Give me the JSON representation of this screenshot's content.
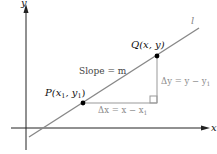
{
  "diagram": {
    "axes": {
      "x_label": "x",
      "y_label": "y"
    },
    "line": {
      "label": "l"
    },
    "points": [
      {
        "id": "P",
        "label": "P(x",
        "sub1": "1",
        "mid": ", y",
        "sub2": "1",
        "end": ")"
      },
      {
        "id": "Q",
        "label": "Q(x, y)"
      }
    ],
    "slope_label": "Slope = m",
    "delta_y": {
      "prefix": "Δy = y − y",
      "sub": "1"
    },
    "delta_x": {
      "prefix": "Δx = x − x",
      "sub": "1"
    },
    "colors": {
      "axis": "#222222",
      "line": "#888888",
      "triangle": "#999999",
      "delta_text": "#8a8a8a",
      "point": "#000000",
      "text": "#111111"
    }
  }
}
